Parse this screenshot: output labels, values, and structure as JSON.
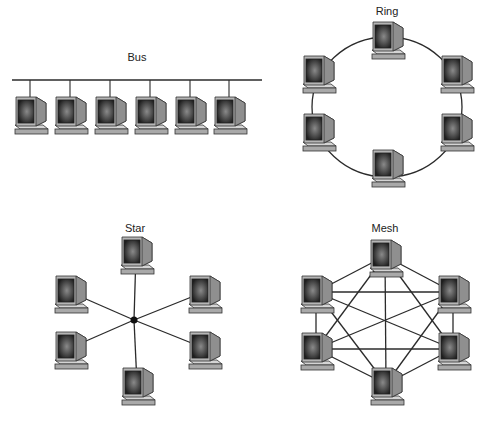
{
  "topologies": [
    {
      "id": "bus",
      "label": "Bus",
      "label_pos": [
        137,
        51
      ],
      "bus_line": {
        "x1": 12,
        "y1": 80,
        "x2": 262,
        "y2": 80
      },
      "nodes": [
        [
          30,
          113
        ],
        [
          70,
          113
        ],
        [
          110,
          113
        ],
        [
          150,
          113
        ],
        [
          190,
          113
        ],
        [
          229,
          113
        ]
      ]
    },
    {
      "id": "ring",
      "label": "Ring",
      "label_pos": [
        387,
        5
      ],
      "ring": {
        "cx": 387,
        "cy": 107,
        "rx": 75,
        "ry": 70
      },
      "nodes": [
        [
          387,
          38
        ],
        [
          318,
          72
        ],
        [
          456,
          72
        ],
        [
          318,
          130
        ],
        [
          456,
          130
        ],
        [
          387,
          166
        ]
      ]
    },
    {
      "id": "star",
      "label": "Star",
      "label_pos": [
        135,
        222
      ],
      "hub": [
        134,
        320
      ],
      "nodes": [
        [
          136,
          253
        ],
        [
          70,
          292
        ],
        [
          204,
          292
        ],
        [
          70,
          348
        ],
        [
          204,
          348
        ],
        [
          137,
          384
        ]
      ]
    },
    {
      "id": "mesh",
      "label": "Mesh",
      "label_pos": [
        385,
        222
      ],
      "nodes": [
        [
          385,
          256
        ],
        [
          316,
          292
        ],
        [
          453,
          292
        ],
        [
          316,
          349
        ],
        [
          453,
          349
        ],
        [
          386,
          384
        ]
      ]
    }
  ],
  "colors": {
    "line": "#2b2b2b",
    "monitor": "#9a9a9a",
    "screen": "#3a3a3a",
    "base": "#bcbcbc"
  }
}
